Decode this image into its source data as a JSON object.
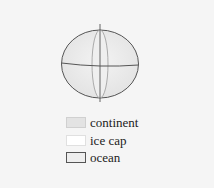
{
  "diagram": {
    "type": "globe",
    "sphere": {
      "cx": 100,
      "cy": 64,
      "rx": 38.5,
      "ry": 34,
      "fill": "#e9e9e9",
      "stroke": "#555555"
    },
    "equator_y": 64,
    "axis": {
      "x": 100,
      "top": 24,
      "bottom": 102
    },
    "ice_band": {
      "rx": 8,
      "fill": "#f6f6f6",
      "stroke": "#888888"
    }
  },
  "legend": {
    "items": [
      {
        "label": "continent",
        "swatch_fill": "#e3e3e3",
        "swatch_border": "#d0d0d0"
      },
      {
        "label": "ice cap",
        "swatch_fill": "#ffffff",
        "swatch_border": "#e0e0e0"
      },
      {
        "label": "ocean",
        "swatch_fill": "#eeeeee",
        "swatch_border": "#555555"
      }
    ]
  }
}
